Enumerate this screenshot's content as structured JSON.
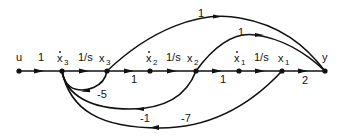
{
  "diagram": {
    "nodes": [
      {
        "id": "u",
        "label": "u",
        "dot": false,
        "x": 19,
        "y": 71
      },
      {
        "id": "x3dot",
        "label": "x",
        "sub": "3",
        "dot": true,
        "x": 62,
        "y": 71
      },
      {
        "id": "x3",
        "label": "x",
        "sub": "3",
        "dot": false,
        "x": 107,
        "y": 71
      },
      {
        "id": "x2dot",
        "label": "x",
        "sub": "2",
        "dot": true,
        "x": 150,
        "y": 71
      },
      {
        "id": "x2",
        "label": "x",
        "sub": "2",
        "dot": false,
        "x": 196,
        "y": 71
      },
      {
        "id": "x1dot",
        "label": "x",
        "sub": "1",
        "dot": true,
        "x": 239,
        "y": 71
      },
      {
        "id": "x1",
        "label": "x",
        "sub": "1",
        "dot": false,
        "x": 282,
        "y": 71
      },
      {
        "id": "y",
        "label": "y",
        "dot": false,
        "x": 325,
        "y": 71
      }
    ],
    "branches": [
      {
        "from": "u",
        "to": "x3dot",
        "gain": "1"
      },
      {
        "from": "x3dot",
        "to": "x3",
        "gain": "1/s"
      },
      {
        "from": "x3",
        "to": "x2dot",
        "gain": "1"
      },
      {
        "from": "x2dot",
        "to": "x2",
        "gain": "1/s"
      },
      {
        "from": "x2",
        "to": "x1dot",
        "gain": "1"
      },
      {
        "from": "x1dot",
        "to": "x1",
        "gain": "1/s"
      },
      {
        "from": "x1",
        "to": "y",
        "gain": "2"
      },
      {
        "from": "x3",
        "to": "y",
        "gain": "1"
      },
      {
        "from": "x2",
        "to": "y",
        "gain": "1"
      },
      {
        "from": "x3",
        "to": "x3dot",
        "gain": "-5"
      },
      {
        "from": "x2",
        "to": "x3dot",
        "gain": "-1"
      },
      {
        "from": "x1",
        "to": "x3dot",
        "gain": "-7"
      }
    ],
    "labels": {
      "u": "u",
      "y": "y",
      "x": "x",
      "s1": "1",
      "s2": "2",
      "s3": "3",
      "g_u_x3d": "1",
      "g_int3": "1/s",
      "g_x3_x2d": "1",
      "g_int2": "1/s",
      "g_x2_x1d": "1",
      "g_int1": "1/s",
      "g_x1_y": "2",
      "g_x3_y": "1",
      "g_x2_y": "1",
      "g_fb5": "-5",
      "g_fb1": "-1",
      "g_fb7": "-7"
    },
    "colors": {
      "ink": "#111111",
      "background": "#ffffff"
    }
  }
}
